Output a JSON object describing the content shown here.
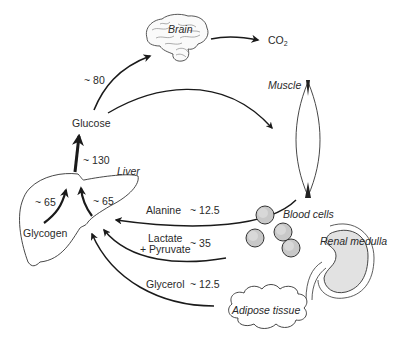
{
  "diagram": {
    "type": "metabolic-flow",
    "nodes": {
      "brain": "Brain",
      "co2": "CO",
      "co2_sub": "2",
      "muscle": "Muscle",
      "glucose": "Glucose",
      "liver": "Liver",
      "glycogen": "Glycogen",
      "blood_cells": "Blood cells",
      "renal_medulla": "Renal medulla",
      "adipose_tissue": "Adipose tissue"
    },
    "flows": [
      {
        "from": "Glucose",
        "to": "Brain",
        "label": "~ 80"
      },
      {
        "from": "Brain",
        "to": "CO2",
        "label": ""
      },
      {
        "from": "Glucose",
        "to": "Muscle",
        "label": ""
      },
      {
        "from": "Liver",
        "to": "Glucose",
        "label": "~ 130"
      },
      {
        "from": "Glycogen",
        "to": "Liver",
        "label": "~ 65"
      },
      {
        "from": "Gluconeogenesis",
        "to": "Liver",
        "label": "~ 65"
      },
      {
        "from": "Muscle",
        "to": "Liver",
        "substrate": "Alanine",
        "label": "~ 12.5"
      },
      {
        "from": "Blood cells / Renal medulla",
        "to": "Liver",
        "substrate": "Lactate + Pyruvate",
        "label": "~ 35"
      },
      {
        "from": "Adipose tissue",
        "to": "Liver",
        "substrate": "Glycerol",
        "label": "~ 12.5"
      }
    ],
    "labels": {
      "brain_flow": "~ 80",
      "liver_out": "~ 130",
      "glycogen_flow": "~ 65",
      "gng_flow": "~ 65",
      "alanine": "Alanine",
      "alanine_val": "~ 12.5",
      "lactate": "Lactate",
      "pyruvate": "+ Pyruvate",
      "lactate_val": "~ 35",
      "glycerol": "Glycerol",
      "glycerol_val": "~ 12.5"
    },
    "colors": {
      "line": "#1a1a1a",
      "cell_fill": "#c8c8c8",
      "kidney_fill": "#e2e2e2"
    }
  }
}
